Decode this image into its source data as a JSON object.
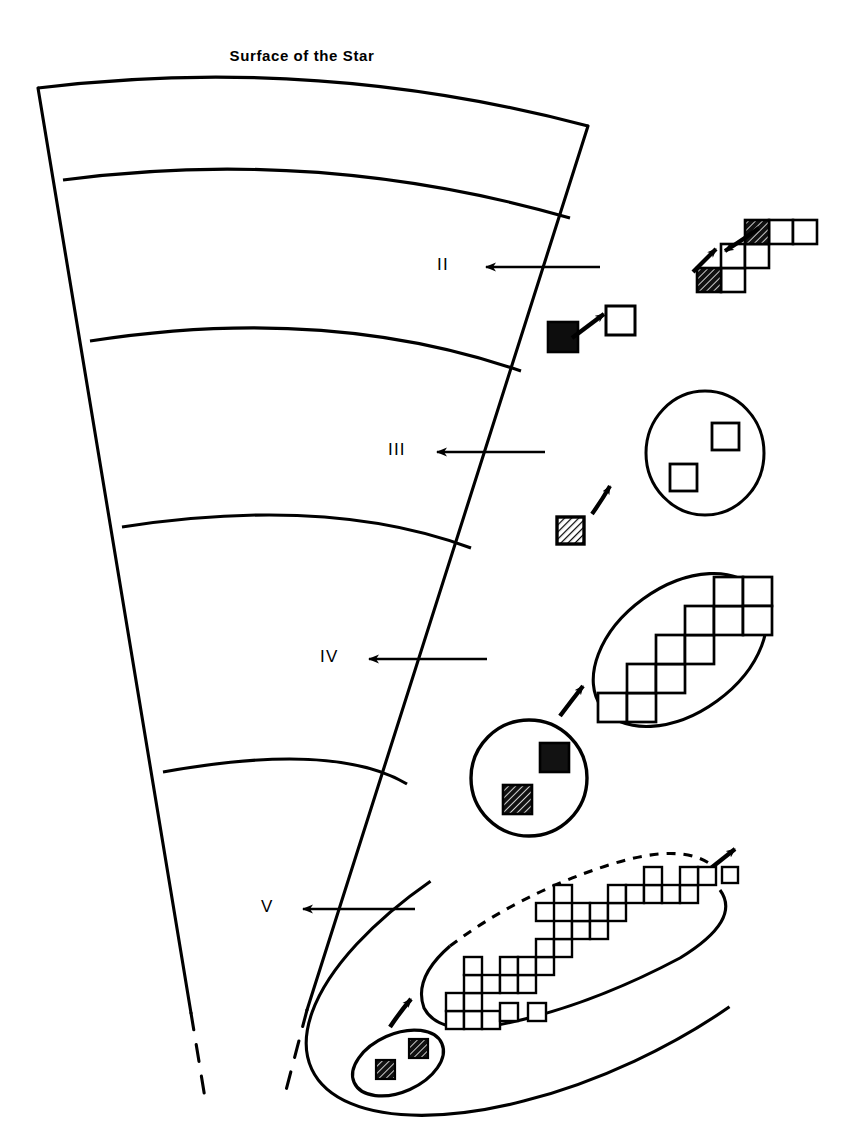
{
  "figure": {
    "title": "Surface of the Star",
    "background_color": "#ffffff",
    "ink_color": "#000000",
    "width": 861,
    "height": 1148
  },
  "zone_labels": [
    {
      "id": "II",
      "label": "II",
      "x": 437,
      "y": 255,
      "arrow_from_x": 600,
      "arrow_to_x": 477,
      "arrow_y": 267
    },
    {
      "id": "III",
      "label": "III",
      "x": 388,
      "y": 440,
      "arrow_from_x": 545,
      "arrow_to_x": 428,
      "arrow_y": 452
    },
    {
      "id": "IV",
      "label": "IV",
      "x": 320,
      "y": 647,
      "arrow_from_x": 487,
      "arrow_to_x": 360,
      "arrow_y": 659
    },
    {
      "id": "V",
      "label": "V",
      "x": 261,
      "y": 897,
      "arrow_from_x": 415,
      "arrow_to_x": 294,
      "arrow_y": 909
    }
  ],
  "wedge": {
    "left_edge_top_x": 38,
    "left_edge_bottom_x": 203,
    "right_edge_top_x": 588,
    "right_edge_bottom_x": 318,
    "top_y": 84,
    "bottom_y": 1090,
    "dashes_at_bottom": true,
    "arc_count": 5,
    "arcs": [
      {
        "name": "surface-arc",
        "left_y": 88,
        "apex_y": 72,
        "right_y": 126
      },
      {
        "name": "arc-II-III",
        "left_y": 180,
        "apex_y": 164,
        "right_y": 218
      },
      {
        "name": "arc-III-IV",
        "left_y": 340,
        "apex_y": 326,
        "right_y": 372
      },
      {
        "name": "arc-IV-V",
        "left_y": 527,
        "apex_y": 513,
        "right_y": 548
      },
      {
        "name": "arc-V-bottom",
        "left_y": 772,
        "apex_y": 760,
        "right_y": 784
      }
    ]
  },
  "motifs": [
    {
      "id": "motif-staircase-small",
      "name": "small-staircase-cluster",
      "zone": "II",
      "squares": [
        {
          "x": 697,
          "y": 268,
          "size": 24,
          "fill": "hatched-dark"
        },
        {
          "x": 721,
          "y": 268,
          "size": 24,
          "fill": "empty"
        },
        {
          "x": 721,
          "y": 244,
          "size": 24,
          "fill": "empty"
        },
        {
          "x": 745,
          "y": 244,
          "size": 24,
          "fill": "empty"
        },
        {
          "x": 745,
          "y": 220,
          "size": 24,
          "fill": "hatched-dark"
        },
        {
          "x": 769,
          "y": 220,
          "size": 24,
          "fill": "empty"
        },
        {
          "x": 793,
          "y": 220,
          "size": 24,
          "fill": "empty"
        }
      ],
      "arrows": [
        {
          "type": "straight",
          "x1": 694,
          "y1": 268,
          "x2": 718,
          "y2": 245
        },
        {
          "type": "curved",
          "x1": 756,
          "y1": 232,
          "x2": 722,
          "y2": 252
        }
      ]
    },
    {
      "id": "motif-pair-II",
      "name": "dark-to-empty-pair",
      "zone": "II",
      "squares": [
        {
          "x": 548,
          "y": 325,
          "size": 28,
          "fill": "solid-dark"
        },
        {
          "x": 607,
          "y": 307,
          "size": 28,
          "fill": "empty"
        }
      ],
      "arrows": [
        {
          "type": "straight",
          "x1": 577,
          "y1": 334,
          "x2": 606,
          "y2": 313
        }
      ]
    },
    {
      "id": "motif-circle-two-empty",
      "name": "circle-with-two-empty-squares",
      "zone": "III",
      "outline": {
        "shape": "circle",
        "cx": 705,
        "cy": 453,
        "rx": 59,
        "ry": 62,
        "dashed": false
      },
      "squares": [
        {
          "x": 712,
          "y": 423,
          "size": 26,
          "fill": "empty"
        },
        {
          "x": 671,
          "y": 464,
          "size": 26,
          "fill": "empty"
        }
      ]
    },
    {
      "id": "motif-hatched-III",
      "name": "hatched-square-with-arrow",
      "zone": "III",
      "squares": [
        {
          "x": 558,
          "y": 518,
          "size": 26,
          "fill": "hatched"
        }
      ],
      "arrows": [
        {
          "type": "curved",
          "x1": 592,
          "y1": 510,
          "x2": 611,
          "y2": 484
        }
      ]
    },
    {
      "id": "motif-ellipse-staircase",
      "name": "ellipse-with-staircase-cluster",
      "zone": "IV",
      "outline": {
        "shape": "ellipse",
        "cx": 680,
        "cy": 650,
        "rx": 96,
        "ry": 62,
        "rotate": -36,
        "dashed": false
      },
      "squares": [
        {
          "x": 598,
          "y": 693,
          "size": 28,
          "fill": "empty"
        },
        {
          "x": 626,
          "y": 693,
          "size": 28,
          "fill": "empty"
        },
        {
          "x": 626,
          "y": 665,
          "size": 28,
          "fill": "empty"
        },
        {
          "x": 654,
          "y": 665,
          "size": 28,
          "fill": "empty"
        },
        {
          "x": 654,
          "y": 637,
          "size": 28,
          "fill": "empty"
        },
        {
          "x": 682,
          "y": 637,
          "size": 28,
          "fill": "empty"
        },
        {
          "x": 682,
          "y": 609,
          "size": 28,
          "fill": "empty"
        },
        {
          "x": 710,
          "y": 609,
          "size": 28,
          "fill": "empty"
        },
        {
          "x": 710,
          "y": 581,
          "size": 28,
          "fill": "empty"
        },
        {
          "x": 738,
          "y": 581,
          "size": 28,
          "fill": "empty"
        }
      ],
      "arrows": [
        {
          "type": "curved",
          "x1": 562,
          "y1": 715,
          "x2": 583,
          "y2": 686
        }
      ]
    },
    {
      "id": "motif-circle-two-dark",
      "name": "circle-with-two-dark-squares",
      "zone": "IV",
      "outline": {
        "shape": "circle",
        "cx": 529,
        "cy": 778,
        "rx": 57,
        "ry": 58,
        "dashed": false
      },
      "squares": [
        {
          "x": 541,
          "y": 744,
          "size": 27,
          "fill": "solid-dark"
        },
        {
          "x": 504,
          "y": 786,
          "size": 27,
          "fill": "hatched-dark"
        }
      ]
    },
    {
      "id": "motif-big-ellipse",
      "name": "large-ellipse-with-tile-cluster",
      "zone": "V",
      "outline": {
        "shape": "ellipse",
        "cx": 580,
        "cy": 944,
        "rx": 165,
        "ry": 72,
        "rotate": -25,
        "dashed_arc": true,
        "arrowhead": true
      },
      "square_size": 17,
      "squares": [
        {
          "x": 446,
          "y": 1010
        },
        {
          "x": 463,
          "y": 1010
        },
        {
          "x": 480,
          "y": 1010
        },
        {
          "x": 463,
          "y": 993
        },
        {
          "x": 463,
          "y": 976
        },
        {
          "x": 463,
          "y": 959
        },
        {
          "x": 446,
          "y": 993
        },
        {
          "x": 497,
          "y": 976
        },
        {
          "x": 514,
          "y": 976
        },
        {
          "x": 531,
          "y": 976
        },
        {
          "x": 497,
          "y": 959
        },
        {
          "x": 514,
          "y": 959
        },
        {
          "x": 531,
          "y": 959
        },
        {
          "x": 548,
          "y": 959
        },
        {
          "x": 531,
          "y": 942
        },
        {
          "x": 548,
          "y": 942
        },
        {
          "x": 565,
          "y": 942
        },
        {
          "x": 548,
          "y": 925
        },
        {
          "x": 565,
          "y": 925
        },
        {
          "x": 565,
          "y": 908
        },
        {
          "x": 582,
          "y": 908
        },
        {
          "x": 582,
          "y": 925
        },
        {
          "x": 599,
          "y": 925
        },
        {
          "x": 599,
          "y": 908
        },
        {
          "x": 616,
          "y": 908
        },
        {
          "x": 616,
          "y": 891
        },
        {
          "x": 633,
          "y": 891
        },
        {
          "x": 650,
          "y": 891
        },
        {
          "x": 667,
          "y": 891
        },
        {
          "x": 684,
          "y": 891
        },
        {
          "x": 650,
          "y": 874
        },
        {
          "x": 667,
          "y": 874
        },
        {
          "x": 684,
          "y": 874
        },
        {
          "x": 701,
          "y": 891
        },
        {
          "x": 497,
          "y": 993
        },
        {
          "x": 531,
          "y": 993
        },
        {
          "x": 514,
          "y": 908
        },
        {
          "x": 548,
          "y": 891
        }
      ],
      "arrows": [
        {
          "type": "curved",
          "x1": 392,
          "y1": 1026,
          "x2": 412,
          "y2": 1000
        }
      ]
    },
    {
      "id": "motif-small-ellipse",
      "name": "small-ellipse-with-two-hatched-squares",
      "zone": "V",
      "outline": {
        "shape": "ellipse",
        "cx": 398,
        "cy": 1063,
        "rx": 47,
        "ry": 28,
        "rotate": -24,
        "dashed": false
      },
      "squares": [
        {
          "x": 410,
          "y": 1040,
          "size": 18,
          "fill": "hatched-dark"
        },
        {
          "x": 378,
          "y": 1060,
          "size": 18,
          "fill": "hatched-dark"
        }
      ]
    }
  ],
  "legend_notes": {
    "empty_square": "empty square tile",
    "hatched_square": "hatched square tile",
    "solid_square": "solid dark square tile",
    "arrow": "transition arrow",
    "dashed_arc": "dashed growing boundary"
  }
}
